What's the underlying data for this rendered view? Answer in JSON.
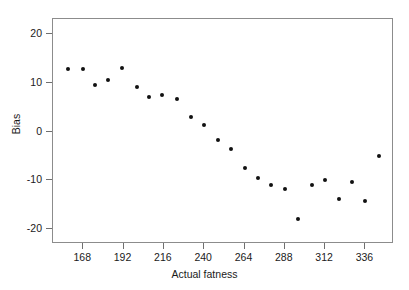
{
  "chart_data": {
    "type": "scatter",
    "title": "",
    "xlabel": "Actual fatness",
    "ylabel": "Bias",
    "xlim": [
      150,
      353
    ],
    "ylim": [
      -23,
      23
    ],
    "grid": false,
    "legend": null,
    "marker": {
      "shape": "circle",
      "color": "#111111",
      "size_px": 4
    },
    "xticks": [
      168,
      192,
      216,
      240,
      264,
      288,
      312,
      336
    ],
    "xtick_labels": [
      "168",
      "192",
      "216",
      "240",
      "264",
      "288",
      "312",
      "336"
    ],
    "yticks": [
      20,
      10,
      0,
      -10,
      -20
    ],
    "ytick_labels": [
      "20",
      "10",
      "0",
      "-10",
      "-20"
    ],
    "series": [
      {
        "name": "Bias vs Actual fatness",
        "points": [
          {
            "x": 159,
            "y": 12.8
          },
          {
            "x": 168,
            "y": 12.8
          },
          {
            "x": 175,
            "y": 9.6
          },
          {
            "x": 183,
            "y": 10.6
          },
          {
            "x": 191,
            "y": 13.0
          },
          {
            "x": 200,
            "y": 9.2
          },
          {
            "x": 207,
            "y": 7.0
          },
          {
            "x": 215,
            "y": 7.4
          },
          {
            "x": 224,
            "y": 6.6
          },
          {
            "x": 232,
            "y": 3.0
          },
          {
            "x": 240,
            "y": 1.4
          },
          {
            "x": 248,
            "y": -1.8
          },
          {
            "x": 256,
            "y": -3.6
          },
          {
            "x": 264,
            "y": -7.4
          },
          {
            "x": 272,
            "y": -9.6
          },
          {
            "x": 280,
            "y": -11.0
          },
          {
            "x": 288,
            "y": -11.8
          },
          {
            "x": 296,
            "y": -17.8
          },
          {
            "x": 304,
            "y": -11.0
          },
          {
            "x": 312,
            "y": -10.0
          },
          {
            "x": 320,
            "y": -13.8
          },
          {
            "x": 328,
            "y": -10.4
          },
          {
            "x": 336,
            "y": -14.2
          },
          {
            "x": 344,
            "y": -5.0
          }
        ]
      }
    ]
  },
  "axes": {
    "x_title": "Actual fatness",
    "y_title": "Bias"
  }
}
